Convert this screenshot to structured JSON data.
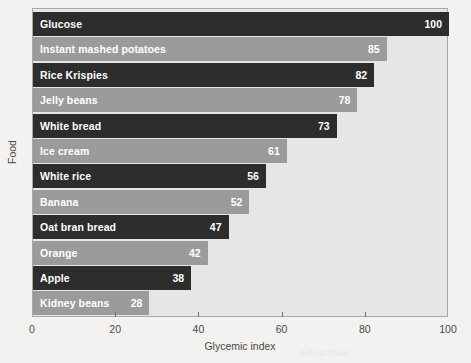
{
  "chart_data": {
    "type": "bar",
    "orientation": "horizontal",
    "title": "",
    "xlabel": "Glycemic index",
    "ylabel": "Food",
    "xlim": [
      0,
      100
    ],
    "xticks": [
      0,
      20,
      40,
      60,
      80,
      100
    ],
    "xtick_labels": [
      "0",
      "20",
      "40",
      "60",
      "80",
      "100"
    ],
    "grid": false,
    "legend": null,
    "categories": [
      "Glucose",
      "Instant mashed potatoes",
      "Rice Krispies",
      "Jelly beans",
      "White bread",
      "Ice cream",
      "White rice",
      "Banana",
      "Oat bran bread",
      "Orange",
      "Apple",
      "Kidney beans"
    ],
    "values": [
      100,
      85,
      82,
      78,
      73,
      61,
      56,
      52,
      47,
      42,
      38,
      28
    ],
    "bars": [
      {
        "label": "Glucose",
        "value": 100,
        "value_text": "100",
        "shade": "dark"
      },
      {
        "label": "Instant mashed potatoes",
        "value": 85,
        "value_text": "85",
        "shade": "light"
      },
      {
        "label": "Rice Krispies",
        "value": 82,
        "value_text": "82",
        "shade": "dark"
      },
      {
        "label": "Jelly beans",
        "value": 78,
        "value_text": "78",
        "shade": "light"
      },
      {
        "label": "White bread",
        "value": 73,
        "value_text": "73",
        "shade": "dark"
      },
      {
        "label": "Ice cream",
        "value": 61,
        "value_text": "61",
        "shade": "light"
      },
      {
        "label": "White rice",
        "value": 56,
        "value_text": "56",
        "shade": "dark"
      },
      {
        "label": "Banana",
        "value": 52,
        "value_text": "52",
        "shade": "light"
      },
      {
        "label": "Oat bran bread",
        "value": 47,
        "value_text": "47",
        "shade": "dark"
      },
      {
        "label": "Orange",
        "value": 42,
        "value_text": "42",
        "shade": "light"
      },
      {
        "label": "Apple",
        "value": 38,
        "value_text": "38",
        "shade": "dark"
      },
      {
        "label": "Kidney beans",
        "value": 28,
        "value_text": "28",
        "shade": "light"
      }
    ],
    "colors": {
      "bar_dark": "#2d2d2d",
      "bar_light": "#9b9b9b",
      "plot_background": "#e7e6e4",
      "page_background": "#f3f2f0",
      "axis": "#6f6e6c",
      "bar_text": "#ffffff",
      "axis_text": "#4a4947"
    }
  },
  "bleed_through": [
    {
      "text": "Build and Corbohydr",
      "type": "title",
      "left": 232,
      "top": 268
    },
    {
      "text": "weight watching the rest at that",
      "type": "body",
      "left": 214,
      "top": 288
    },
    {
      "text": "in our bodies, cereals nutrient",
      "type": "body",
      "left": 214,
      "top": 300
    },
    {
      "text": "saccharides",
      "type": "body",
      "left": 300,
      "top": 348
    }
  ]
}
